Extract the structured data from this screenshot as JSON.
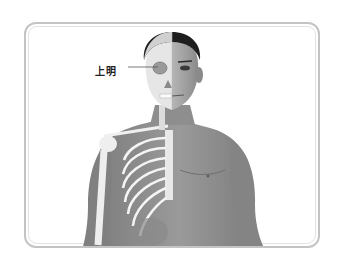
{
  "illustration": {
    "subject": "Anatomical figure: left half skeleton, right half skin-covered human torso and head",
    "annotation": {
      "label": "上明",
      "target": "eye"
    }
  },
  "colors": {
    "frame": "#c4c4c4",
    "skin": "#8f8f8f",
    "bone": "#f2f2f2",
    "hair": "#1e1e1e",
    "label_text": "#222222"
  }
}
